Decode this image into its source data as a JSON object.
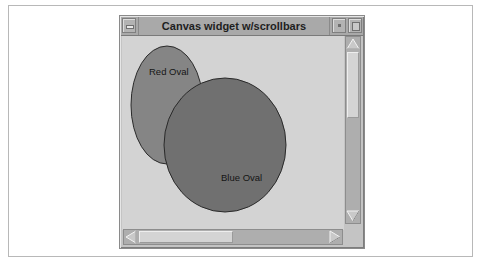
{
  "window": {
    "title": "Canvas widget w/scrollbars",
    "controls": {
      "menu_icon": "window-menu-icon",
      "minimize_icon": "minimize-icon",
      "maximize_icon": "maximize-icon"
    }
  },
  "canvas": {
    "background": "#d3d3d3",
    "items": [
      {
        "type": "oval",
        "label": "Red Oval",
        "fill": "#858585",
        "outline": "#2a2a2a"
      },
      {
        "type": "oval",
        "label": "Blue Oval",
        "fill": "#707070",
        "outline": "#2a2a2a"
      }
    ]
  },
  "scrollbars": {
    "vertical": {
      "position_fraction": 0.0,
      "visible_fraction": 0.42,
      "up_icon": "arrow-up-icon",
      "down_icon": "arrow-down-icon"
    },
    "horizontal": {
      "position_fraction": 0.0,
      "visible_fraction": 0.5,
      "left_icon": "arrow-left-icon",
      "right_icon": "arrow-right-icon"
    }
  }
}
